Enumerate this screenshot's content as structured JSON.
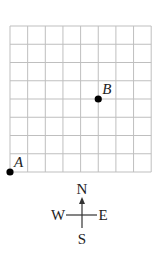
{
  "grid": {
    "columns": 8,
    "rows": 8,
    "line_color": "#bfbfbf",
    "origin_px": [
      10,
      172
    ],
    "cell_w": 17.65,
    "cell_h": 18.25
  },
  "points": [
    {
      "label": "A",
      "gx": 0,
      "gy": 0
    },
    {
      "label": "B",
      "gx": 5,
      "gy": 4
    }
  ],
  "compass": {
    "north": "N",
    "south": "S",
    "east": "E",
    "west": "W"
  },
  "colors": {
    "point": "#000000",
    "text": "#222222",
    "compass_line": "#333333"
  }
}
